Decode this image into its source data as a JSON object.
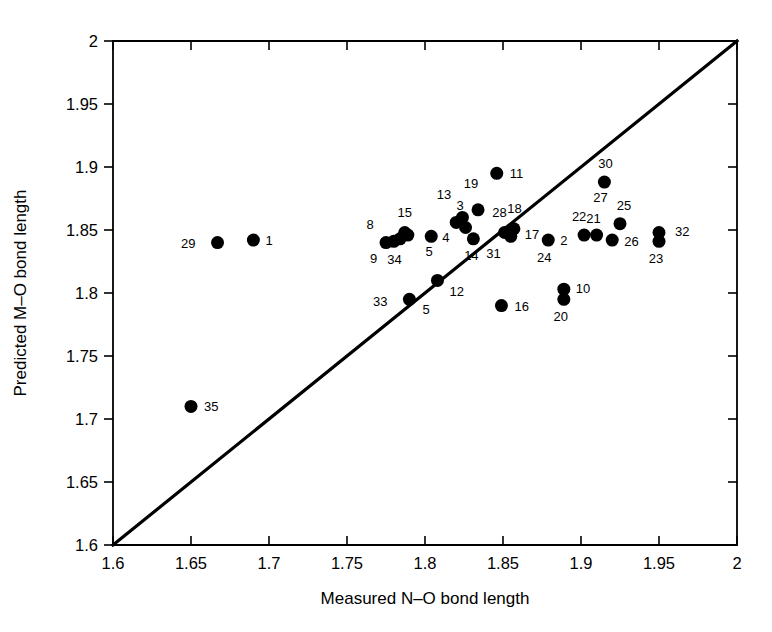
{
  "chart_data": {
    "type": "scatter",
    "title": "",
    "xlabel": "Measured N–O bond length",
    "ylabel": "Predicted M–O bond length",
    "xlim": [
      1.6,
      2.0
    ],
    "ylim": [
      1.6,
      2.0
    ],
    "xticks": [
      "1.6",
      "1.65",
      "1.7",
      "1.75",
      "1.8",
      "1.85",
      "1.9",
      "1.95",
      "2"
    ],
    "yticks": [
      "1.6",
      "1.65",
      "1.7",
      "1.75",
      "1.8",
      "1.85",
      "1.9",
      "1.95",
      "2"
    ],
    "xtick_values": [
      1.6,
      1.65,
      1.7,
      1.75,
      1.8,
      1.85,
      1.9,
      1.95,
      2.0
    ],
    "ytick_values": [
      1.6,
      1.65,
      1.7,
      1.75,
      1.8,
      1.85,
      1.9,
      1.95,
      2.0
    ],
    "grid": false,
    "legend": null,
    "marker_color": "#000000",
    "marker_size": 6.5,
    "reference_line": {
      "name": "identity-line",
      "from": [
        1.6,
        1.6
      ],
      "to": [
        2.0,
        2.0
      ],
      "color": "#000000"
    },
    "points": [
      {
        "label": "1",
        "x": 1.69,
        "y": 1.842,
        "lx": 12,
        "ly": 5
      },
      {
        "label": "2",
        "x": 1.879,
        "y": 1.842,
        "lx": 12,
        "ly": 5
      },
      {
        "label": "3",
        "x": 1.825,
        "y": 1.858,
        "lx": -4,
        "ly": -10
      },
      {
        "label": "4",
        "x": 1.804,
        "y": 1.845,
        "lx": 11,
        "ly": 6
      },
      {
        "label": "5",
        "x": 1.79,
        "y": 1.795,
        "lx": 13,
        "ly": 15
      },
      {
        "label": "5",
        "x": 1.804,
        "y": 1.845,
        "lx": -2,
        "ly": 20
      },
      {
        "label": "8",
        "x": 1.778,
        "y": 1.843,
        "lx": -17,
        "ly": -10
      },
      {
        "label": "9",
        "x": 1.779,
        "y": 1.84,
        "lx": -15,
        "ly": 20
      },
      {
        "label": "10",
        "x": 1.889,
        "y": 1.803,
        "lx": 12,
        "ly": 4
      },
      {
        "label": "11",
        "x": 1.846,
        "y": 1.895,
        "lx": 13,
        "ly": 5
      },
      {
        "label": "12",
        "x": 1.808,
        "y": 1.81,
        "lx": 12,
        "ly": 16
      },
      {
        "label": "13",
        "x": 1.822,
        "y": 1.86,
        "lx": -8,
        "ly": -18
      },
      {
        "label": "14",
        "x": 1.831,
        "y": 1.843,
        "lx": -2,
        "ly": 21
      },
      {
        "label": "15",
        "x": 1.789,
        "y": 1.848,
        "lx": -3,
        "ly": -16
      },
      {
        "label": "16",
        "x": 1.849,
        "y": 1.79,
        "lx": 13,
        "ly": 5
      },
      {
        "label": "17",
        "x": 1.855,
        "y": 1.848,
        "lx": 14,
        "ly": 6
      },
      {
        "label": "18",
        "x": 1.86,
        "y": 1.852,
        "lx": -4,
        "ly": -14
      },
      {
        "label": "19",
        "x": 1.832,
        "y": 1.866,
        "lx": -4,
        "ly": -22
      },
      {
        "label": "20",
        "x": 1.889,
        "y": 1.795,
        "lx": -3,
        "ly": 22
      },
      {
        "label": "21",
        "x": 1.91,
        "y": 1.846,
        "lx": -3,
        "ly": -12
      },
      {
        "label": "22",
        "x": 1.902,
        "y": 1.846,
        "lx": -5,
        "ly": -14
      },
      {
        "label": "23",
        "x": 1.95,
        "y": 1.843,
        "lx": -3,
        "ly": 24
      },
      {
        "label": "24",
        "x": 1.879,
        "y": 1.842,
        "lx": -4,
        "ly": 22
      },
      {
        "label": "25",
        "x": 1.925,
        "y": 1.855,
        "lx": 4,
        "ly": -14
      },
      {
        "label": "26",
        "x": 1.92,
        "y": 1.842,
        "lx": 12,
        "ly": 6
      },
      {
        "label": "27",
        "x": 1.915,
        "y": 1.888,
        "lx": -4,
        "ly": 20
      },
      {
        "label": "28",
        "x": 1.836,
        "y": 1.866,
        "lx": 11,
        "ly": 7
      },
      {
        "label": "29",
        "x": 1.667,
        "y": 1.84,
        "lx": -22,
        "ly": 5
      },
      {
        "label": "30",
        "x": 1.915,
        "y": 1.888,
        "lx": 1,
        "ly": -14
      },
      {
        "label": "31",
        "x": 1.853,
        "y": 1.845,
        "lx": -7,
        "ly": 22
      },
      {
        "label": "32",
        "x": 1.95,
        "y": 1.848,
        "lx": 16,
        "ly": 3
      },
      {
        "label": "33",
        "x": 1.79,
        "y": 1.795,
        "lx": -22,
        "ly": 7
      },
      {
        "label": "34",
        "x": 1.783,
        "y": 1.84,
        "lx": -4,
        "ly": 21
      },
      {
        "label": "35",
        "x": 1.65,
        "y": 1.71,
        "lx": 13,
        "ly": 5
      }
    ],
    "marker_positions": [
      {
        "x": 1.667,
        "y": 1.84
      },
      {
        "x": 1.69,
        "y": 1.842
      },
      {
        "x": 1.65,
        "y": 1.71
      },
      {
        "x": 1.775,
        "y": 1.84
      },
      {
        "x": 1.78,
        "y": 1.841
      },
      {
        "x": 1.784,
        "y": 1.843
      },
      {
        "x": 1.787,
        "y": 1.848
      },
      {
        "x": 1.789,
        "y": 1.846
      },
      {
        "x": 1.804,
        "y": 1.845
      },
      {
        "x": 1.82,
        "y": 1.856
      },
      {
        "x": 1.824,
        "y": 1.86
      },
      {
        "x": 1.826,
        "y": 1.852
      },
      {
        "x": 1.831,
        "y": 1.843
      },
      {
        "x": 1.834,
        "y": 1.866
      },
      {
        "x": 1.846,
        "y": 1.895
      },
      {
        "x": 1.79,
        "y": 1.795
      },
      {
        "x": 1.808,
        "y": 1.81
      },
      {
        "x": 1.849,
        "y": 1.79
      },
      {
        "x": 1.851,
        "y": 1.848
      },
      {
        "x": 1.855,
        "y": 1.845
      },
      {
        "x": 1.857,
        "y": 1.851
      },
      {
        "x": 1.879,
        "y": 1.842
      },
      {
        "x": 1.889,
        "y": 1.803
      },
      {
        "x": 1.889,
        "y": 1.795
      },
      {
        "x": 1.902,
        "y": 1.846
      },
      {
        "x": 1.91,
        "y": 1.846
      },
      {
        "x": 1.915,
        "y": 1.888
      },
      {
        "x": 1.925,
        "y": 1.855
      },
      {
        "x": 1.92,
        "y": 1.842
      },
      {
        "x": 1.95,
        "y": 1.848
      },
      {
        "x": 1.95,
        "y": 1.841
      }
    ]
  }
}
